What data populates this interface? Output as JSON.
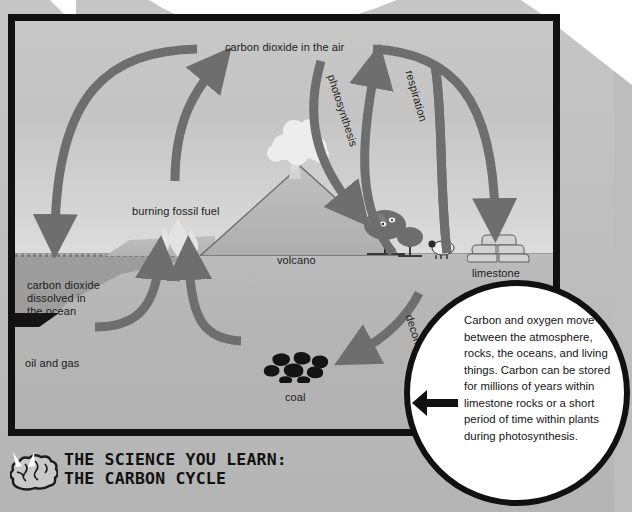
{
  "figure": {
    "title_line1": "THE SCIENCE YOU LEARN:",
    "title_line2": "THE CARBON CYCLE",
    "brain_icon": "brain-icon"
  },
  "diagram": {
    "labels": {
      "co2_air": "carbon dioxide in the air",
      "burning_fossil_fuel": "burning fossil fuel",
      "volcano": "volcano",
      "limestone": "limestone",
      "coal": "coal",
      "oil_and_gas": "oil and gas",
      "co2_ocean": "carbon dioxide\ndissolved in\nthe ocean",
      "photosynthesis": "photosynthesis",
      "respiration": "respiration",
      "decomposition": "decomposition"
    },
    "elements": {
      "volcano_icon": "volcano-icon",
      "ash_plume_icon": "ash-cloud-icon",
      "fire_icon": "flame-icon",
      "coal_icon": "coal-rocks-icon",
      "limestone_icon": "limestone-rocks-icon",
      "tree_large_icon": "tree-icon",
      "tree_small_icon": "tree-icon",
      "sheep_icon": "sheep-icon",
      "ocean_icon": "ocean-icon",
      "oil_deposit_icon": "oil-deposit-icon"
    },
    "arrows": [
      {
        "name": "arrow-air-to-ocean",
        "from": "carbon dioxide in the air",
        "to": "carbon dioxide dissolved in the ocean"
      },
      {
        "name": "arrow-fossil-fuel-to-air",
        "from": "burning fossil fuel",
        "to": "carbon dioxide in the air"
      },
      {
        "name": "arrow-photosynthesis",
        "from": "carbon dioxide in the air",
        "to": "trees"
      },
      {
        "name": "arrow-respiration",
        "from": "animals",
        "to": "carbon dioxide in the air"
      },
      {
        "name": "arrow-air-to-limestone",
        "from": "carbon dioxide in the air",
        "to": "limestone"
      },
      {
        "name": "arrow-decomposition",
        "from": "living things",
        "to": "coal"
      },
      {
        "name": "arrow-oil-gas-to-surface",
        "from": "oil and gas",
        "to": "burning fossil fuel"
      },
      {
        "name": "arrow-coal-to-surface",
        "from": "coal",
        "to": "burning fossil fuel"
      }
    ]
  },
  "callout": {
    "text": "Carbon and oxygen move between the atmosphere, rocks, the oceans, and living things. Carbon can be stored for millions of years within limestone rocks or a short period of time within plants during photosynthesis.",
    "pointer_icon": "left-arrow-icon"
  },
  "colors": {
    "frame": "#111111",
    "arrow": "#6e6e6e",
    "sky": "#c6c6c6",
    "ground": "#b6b6b6",
    "ocean": "#9d9d9d",
    "coal": "#141414",
    "callout_bg": "#ffffff",
    "page_bg": "#bdbdbd"
  }
}
